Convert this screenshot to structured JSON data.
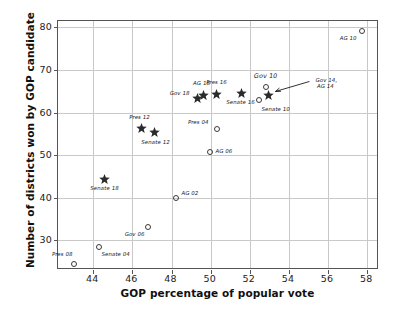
{
  "chart_data": {
    "type": "scatter",
    "title": "",
    "xlabel": "GOP percentage of popular vote",
    "ylabel": "Number of districts won by GOP candidate",
    "xlim": [
      42.2,
      58.6
    ],
    "ylim": [
      23.0,
      81.5
    ],
    "xticks": [
      44,
      46,
      48,
      50,
      52,
      54,
      56,
      58
    ],
    "yticks": [
      30,
      40,
      50,
      60,
      70,
      80
    ],
    "grid": true,
    "legend": "none",
    "marker_meaning": {
      "circle": "open circle (pre-redistricting / earlier cycle)",
      "star": "filled star (post-redistricting / later cycle)"
    },
    "points": [
      {
        "label": "Pres 08",
        "x": 43.0,
        "y": 24.5,
        "marker": "circle",
        "lx": -1,
        "ly": -8,
        "align": "right"
      },
      {
        "label": "Senate 04",
        "x": 44.3,
        "y": 28.3,
        "marker": "circle",
        "lx": 3,
        "ly": 9,
        "align": "left"
      },
      {
        "label": "Gov 06",
        "x": 46.8,
        "y": 33.1,
        "marker": "circle",
        "lx": -3,
        "ly": 9,
        "align": "right"
      },
      {
        "label": "AG 02",
        "x": 48.25,
        "y": 40.0,
        "marker": "circle",
        "lx": 6,
        "ly": -3,
        "align": "left"
      },
      {
        "label": "Senate 18",
        "x": 44.6,
        "y": 44.2,
        "marker": "star",
        "lx": 0,
        "ly": 10,
        "align": "center"
      },
      {
        "label": "AG 06",
        "x": 49.95,
        "y": 50.8,
        "marker": "circle",
        "lx": 6,
        "ly": 1,
        "align": "left"
      },
      {
        "label": "Senate 12",
        "x": 47.15,
        "y": 55.2,
        "marker": "star",
        "lx": 1,
        "ly": 11,
        "align": "center"
      },
      {
        "label": "Pres 12",
        "x": 46.45,
        "y": 56.2,
        "marker": "star",
        "lx": -1,
        "ly": -10,
        "align": "center"
      },
      {
        "label": "Pres 04",
        "x": 50.3,
        "y": 56.2,
        "marker": "circle",
        "lx": -8,
        "ly": -5,
        "align": "right"
      },
      {
        "label": "Senate 10",
        "x": 52.45,
        "y": 63.0,
        "marker": "circle",
        "lx": 3,
        "ly": 11,
        "align": "left"
      },
      {
        "label": "Gov 18",
        "x": 49.35,
        "y": 63.2,
        "marker": "star",
        "lx": -8,
        "ly": -4,
        "align": "right"
      },
      {
        "label": "Gov 14, AG 14",
        "x": 52.95,
        "y": 64.0,
        "marker": "star",
        "lx": 0,
        "ly": 0,
        "align": "none"
      },
      {
        "label": "AG 18",
        "x": 49.65,
        "y": 64.1,
        "marker": "star",
        "lx": -2,
        "ly": -10,
        "align": "center"
      },
      {
        "label": "Pres 16",
        "x": 50.3,
        "y": 64.2,
        "marker": "star",
        "lx": 0,
        "ly": -11,
        "align": "center"
      },
      {
        "label": "Senate 16",
        "x": 51.6,
        "y": 64.5,
        "marker": "star",
        "lx": -1,
        "ly": 11,
        "align": "center"
      },
      {
        "label": "Gov 10",
        "x": 52.85,
        "y": 66.1,
        "marker": "circle",
        "lx": 0,
        "ly": -10,
        "align": "center"
      },
      {
        "label": "AG 10",
        "x": 57.75,
        "y": 79.1,
        "marker": "circle",
        "lx": -5,
        "ly": 9,
        "align": "right"
      }
    ],
    "callout": {
      "text": "Gov 14,\nAG 14",
      "target_point": "Gov 14, AG 14"
    }
  }
}
